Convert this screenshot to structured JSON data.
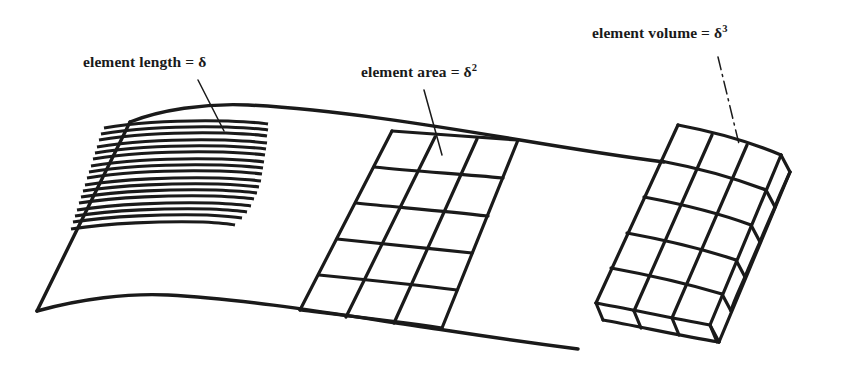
{
  "figure": {
    "background_color": "#ffffff",
    "ink_color": "#1a1a1a",
    "labels": {
      "length": {
        "text": "element length = ",
        "symbol": "δ",
        "exponent": ""
      },
      "area": {
        "text": "element area = ",
        "symbol": "δ",
        "exponent": "2"
      },
      "volume": {
        "text": "element volume = ",
        "symbol": "δ",
        "exponent": "3"
      }
    },
    "regions": {
      "line_elements": {
        "name": "hatched-line-element-patch",
        "line_count": 17
      },
      "area_elements": {
        "name": "quad-grid-patch",
        "columns": 3,
        "rows": 5
      },
      "volume_elements": {
        "name": "extruded-block-patch",
        "columns": 3,
        "rows": 5,
        "layers": 1
      }
    }
  }
}
